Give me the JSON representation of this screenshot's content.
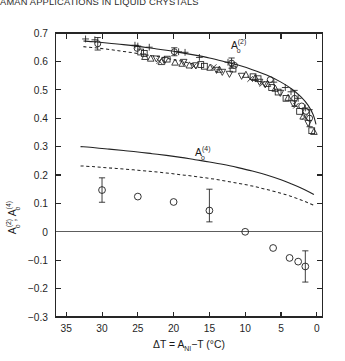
{
  "running_head": "AMAN APPLICATIONS IN LIQUID CRYSTALS",
  "figure": {
    "curve_labels": {
      "upper": {
        "base": "A",
        "sub": "o",
        "sup": "(2)"
      },
      "lower": {
        "base": "A",
        "sub": "o",
        "sup": "(4)"
      }
    },
    "axis_titles": {
      "x": "ΔT = Aₙᵢ−T (°C)",
      "x_parts": {
        "lead": "ΔT = A",
        "sub": "NI",
        "tail": "−T (°C)"
      },
      "y_parts": {
        "base1": "A",
        "sub1": "o",
        "sup1": "(2)",
        "sep": ", ",
        "base2": "A",
        "sub2": "o",
        "sup2": "(4)"
      }
    }
  },
  "chart_data": {
    "type": "scatter",
    "title": "",
    "xlabel": "ΔT = A_NI−T (°C)",
    "ylabel": "A_o^(2), A_o^(4)",
    "xlim": [
      36.5,
      -0.8
    ],
    "ylim": [
      -0.3,
      0.7
    ],
    "x_reversed": true,
    "grid": false,
    "legend": "none",
    "xticks": [
      35,
      30,
      25,
      20,
      15,
      10,
      5,
      0
    ],
    "yticks": [
      0.7,
      0.6,
      0.5,
      0.4,
      0.3,
      0.2,
      0.1,
      0,
      -0.1,
      -0.2,
      -0.3
    ],
    "ytick_labels": [
      "0.7",
      "0.6",
      "0.5",
      "0.4",
      "0.3",
      "0.2",
      "0.1",
      "0",
      "−0.1",
      "−0.2",
      "−0.3"
    ],
    "xtick_labels": [
      "35",
      "30",
      "25",
      "20",
      "15",
      "10",
      "5",
      "0"
    ],
    "annotations": [
      {
        "text": "A_o^(2)",
        "x": 12.0,
        "y": 0.645
      },
      {
        "text": "A_o^(4)",
        "x": 17.0,
        "y": 0.268
      }
    ],
    "theory_curves": [
      {
        "name": "A_o^(2) solid theory",
        "style": "solid",
        "x": [
          32.6,
          31,
          29,
          27,
          25,
          23,
          21,
          19,
          17,
          15,
          13,
          11,
          9,
          7,
          5,
          3.5,
          2.2,
          1.2,
          0.5,
          0.1
        ],
        "y": [
          0.672,
          0.669,
          0.664,
          0.659,
          0.653,
          0.646,
          0.639,
          0.631,
          0.622,
          0.612,
          0.6,
          0.587,
          0.571,
          0.552,
          0.527,
          0.503,
          0.475,
          0.445,
          0.412,
          0.378
        ]
      },
      {
        "name": "A_o^(2) dashed theory",
        "style": "dashed",
        "x": [
          32.6,
          31,
          29,
          27,
          25,
          23,
          21,
          19,
          17
        ],
        "y": [
          0.652,
          0.648,
          0.642,
          0.635,
          0.628,
          0.62,
          0.611,
          0.601,
          0.59
        ]
      },
      {
        "name": "A_o^(4) solid theory",
        "style": "solid",
        "x": [
          33.0,
          31,
          29,
          27,
          25,
          23,
          21,
          19,
          17,
          15,
          13,
          11,
          9,
          7,
          5,
          3.5,
          2.2,
          1.2,
          0.4
        ],
        "y": [
          0.3,
          0.296,
          0.291,
          0.286,
          0.281,
          0.275,
          0.269,
          0.262,
          0.254,
          0.246,
          0.237,
          0.226,
          0.214,
          0.2,
          0.183,
          0.168,
          0.154,
          0.142,
          0.131
        ]
      },
      {
        "name": "A_o^(4) dashed theory",
        "style": "dashed",
        "x": [
          33.0,
          31,
          29,
          27,
          25,
          23,
          21,
          19,
          17,
          15,
          13,
          11,
          9,
          7,
          5,
          3.5,
          2.2,
          1.2,
          0.4
        ],
        "y": [
          0.232,
          0.229,
          0.225,
          0.221,
          0.217,
          0.212,
          0.207,
          0.201,
          0.195,
          0.188,
          0.18,
          0.171,
          0.161,
          0.149,
          0.136,
          0.124,
          0.112,
          0.102,
          0.093
        ]
      }
    ],
    "series": [
      {
        "name": "A_o^(2) plus",
        "marker": "plus",
        "points": [
          {
            "x": 32.3,
            "y": 0.679
          },
          {
            "x": 31.0,
            "y": 0.676
          },
          {
            "x": 25.4,
            "y": 0.657
          },
          {
            "x": 25.0,
            "y": 0.654
          },
          {
            "x": 23.4,
            "y": 0.65
          },
          {
            "x": 19.3,
            "y": 0.634
          },
          {
            "x": 18.4,
            "y": 0.632
          },
          {
            "x": 16.4,
            "y": 0.614
          },
          {
            "x": 12.4,
            "y": 0.597
          },
          {
            "x": 6.0,
            "y": 0.527
          },
          {
            "x": 4.4,
            "y": 0.508
          },
          {
            "x": 3.6,
            "y": 0.493
          },
          {
            "x": 2.6,
            "y": 0.47
          },
          {
            "x": 1.6,
            "y": 0.436
          }
        ]
      },
      {
        "name": "A_o^(2) open circle",
        "marker": "circle",
        "points": [
          {
            "x": 30.6,
            "y": 0.662
          },
          {
            "x": 25.1,
            "y": 0.646
          },
          {
            "x": 19.9,
            "y": 0.634
          },
          {
            "x": 11.9,
            "y": 0.594
          },
          {
            "x": 11.5,
            "y": 0.586
          },
          {
            "x": 6.5,
            "y": 0.536
          },
          {
            "x": 3.1,
            "y": 0.47
          },
          {
            "x": 2.1,
            "y": 0.443
          },
          {
            "x": 1.5,
            "y": 0.424
          },
          {
            "x": 1.0,
            "y": 0.4
          }
        ]
      },
      {
        "name": "A_o^(2) open square",
        "marker": "square",
        "points": [
          {
            "x": 24.6,
            "y": 0.633
          },
          {
            "x": 24.1,
            "y": 0.628
          },
          {
            "x": 20.9,
            "y": 0.608
          },
          {
            "x": 16.2,
            "y": 0.589
          },
          {
            "x": 15.7,
            "y": 0.583
          },
          {
            "x": 11.7,
            "y": 0.573
          },
          {
            "x": 8.9,
            "y": 0.546
          },
          {
            "x": 8.2,
            "y": 0.539
          },
          {
            "x": 6.3,
            "y": 0.508
          },
          {
            "x": 5.4,
            "y": 0.492
          },
          {
            "x": 4.3,
            "y": 0.47
          },
          {
            "x": 2.4,
            "y": 0.424
          },
          {
            "x": 0.7,
            "y": 0.356
          }
        ]
      },
      {
        "name": "A_o^(2) open up triangle",
        "marker": "triangle-up",
        "points": [
          {
            "x": 24.0,
            "y": 0.616
          },
          {
            "x": 23.2,
            "y": 0.61
          },
          {
            "x": 21.7,
            "y": 0.598
          },
          {
            "x": 19.8,
            "y": 0.596
          },
          {
            "x": 18.8,
            "y": 0.592
          },
          {
            "x": 17.8,
            "y": 0.586
          },
          {
            "x": 14.9,
            "y": 0.578
          },
          {
            "x": 13.6,
            "y": 0.571
          },
          {
            "x": 9.9,
            "y": 0.553
          },
          {
            "x": 8.6,
            "y": 0.542
          },
          {
            "x": 6.9,
            "y": 0.521
          },
          {
            "x": 5.8,
            "y": 0.504
          },
          {
            "x": 4.0,
            "y": 0.472
          },
          {
            "x": 1.9,
            "y": 0.406
          },
          {
            "x": 0.4,
            "y": 0.352
          }
        ]
      },
      {
        "name": "A_o^(2) open down triangle",
        "marker": "triangle-down",
        "points": [
          {
            "x": 22.4,
            "y": 0.61
          },
          {
            "x": 21.2,
            "y": 0.605
          },
          {
            "x": 18.6,
            "y": 0.598
          },
          {
            "x": 16.9,
            "y": 0.586
          },
          {
            "x": 14.0,
            "y": 0.57
          },
          {
            "x": 13.2,
            "y": 0.563
          },
          {
            "x": 12.2,
            "y": 0.556
          },
          {
            "x": 10.5,
            "y": 0.549
          },
          {
            "x": 8.0,
            "y": 0.528
          },
          {
            "x": 7.2,
            "y": 0.519
          },
          {
            "x": 5.1,
            "y": 0.489
          },
          {
            "x": 3.3,
            "y": 0.452
          },
          {
            "x": 1.2,
            "y": 0.383
          }
        ]
      },
      {
        "name": "A_o^(2) cross",
        "marker": "cross",
        "points": [
          {
            "x": 22.0,
            "y": 0.601
          },
          {
            "x": 17.2,
            "y": 0.583
          },
          {
            "x": 14.4,
            "y": 0.58
          },
          {
            "x": 9.3,
            "y": 0.538
          },
          {
            "x": 7.6,
            "y": 0.521
          },
          {
            "x": 2.9,
            "y": 0.444
          },
          {
            "x": 1.7,
            "y": 0.404
          }
        ]
      },
      {
        "name": "A_o^(4) open circle",
        "marker": "circle-large",
        "points": [
          {
            "x": 30.0,
            "y": 0.147,
            "yerr": [
              0.043,
              0.043
            ]
          },
          {
            "x": 25.0,
            "y": 0.124
          },
          {
            "x": 20.0,
            "y": 0.105
          },
          {
            "x": 15.0,
            "y": 0.075,
            "yerr": [
              0.075,
              0.04
            ]
          },
          {
            "x": 10.0,
            "y": 0.0
          },
          {
            "x": 6.1,
            "y": -0.057
          },
          {
            "x": 3.8,
            "y": -0.092
          },
          {
            "x": 2.6,
            "y": -0.105
          },
          {
            "x": 1.6,
            "y": -0.122,
            "yerr": [
              0.055,
              0.055
            ]
          }
        ]
      }
    ],
    "error_bars_upper": [
      {
        "x": 30.6,
        "y": 0.662,
        "yerr": [
          0.022,
          0.022
        ]
      },
      {
        "x": 19.9,
        "y": 0.634,
        "yerr": [
          0.014,
          0.014
        ]
      },
      {
        "x": 11.9,
        "y": 0.594,
        "yerr": [
          0.018,
          0.018
        ]
      },
      {
        "x": 3.1,
        "y": 0.47,
        "yerr": [
          0.028,
          0.028
        ]
      },
      {
        "x": 1.0,
        "y": 0.4,
        "yerr": [
          0.03,
          0.03
        ]
      }
    ]
  }
}
